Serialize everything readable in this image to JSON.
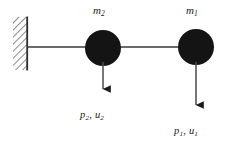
{
  "figure": {
    "kind": "mechanical-system-diagram",
    "background_color": "#ffffff",
    "ink_color": "#1a1a1a",
    "mass_fill_color": "#141414",
    "rod_color": "#3a3a3a",
    "wall_hatch_color": "#6e6e6e"
  },
  "wall": {
    "name": "fixed-support",
    "x": 13,
    "y": 17,
    "width": 15,
    "height": 53,
    "hatch_direction": "45deg",
    "edge_side": "right"
  },
  "rod": {
    "name": "connecting-rod",
    "y": 47,
    "x_start": 28,
    "x_end": 214
  },
  "masses": [
    {
      "id": "m2",
      "label": "m",
      "subscript": "2",
      "cx": 103,
      "cy": 48,
      "r": 18
    },
    {
      "id": "m1",
      "label": "m",
      "subscript": "1",
      "cx": 196,
      "cy": 47,
      "r": 18
    }
  ],
  "forces": [
    {
      "id": "p2",
      "symbol_force": "p",
      "symbol_displacement": "u",
      "subscript": "2",
      "label_text": "p2, u2",
      "direction": "down",
      "x": 103,
      "y_start": 62,
      "y_end": 97
    },
    {
      "id": "p1",
      "symbol_force": "p",
      "symbol_displacement": "u",
      "subscript": "1",
      "label_text": "p1, u1",
      "direction": "down",
      "x": 196,
      "y_start": 62,
      "y_end": 113
    }
  ]
}
